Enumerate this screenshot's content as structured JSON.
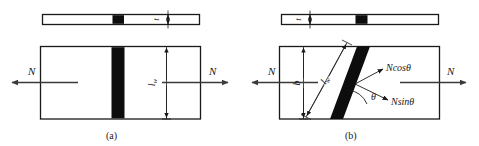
{
  "figure": {
    "background_color": "#ffffff",
    "line_color": "#1a1a1a",
    "weld_fill_color": "#0d0d0d",
    "arrow_color": "#3a3a3a",
    "width": 479,
    "height": 146
  },
  "panel_a": {
    "caption": "(a)",
    "thickness_label": "t",
    "weld_length_label": "l",
    "weld_length_sub": "w",
    "force_left_label": "N",
    "force_right_label": "N",
    "description": "Transverse butt weld, plan and elevation views"
  },
  "panel_b": {
    "caption": "(b)",
    "thickness_label": "t",
    "weld_length_label": "l",
    "weld_length_sub": "w",
    "width_label": "b",
    "force_left_label": "N",
    "force_right_label": "N",
    "force_normal_label": "Ncosθ",
    "force_shear_label": "Nsinθ",
    "angle_label": "θ",
    "description": "Inclined butt weld at angle theta with resolved force components"
  }
}
